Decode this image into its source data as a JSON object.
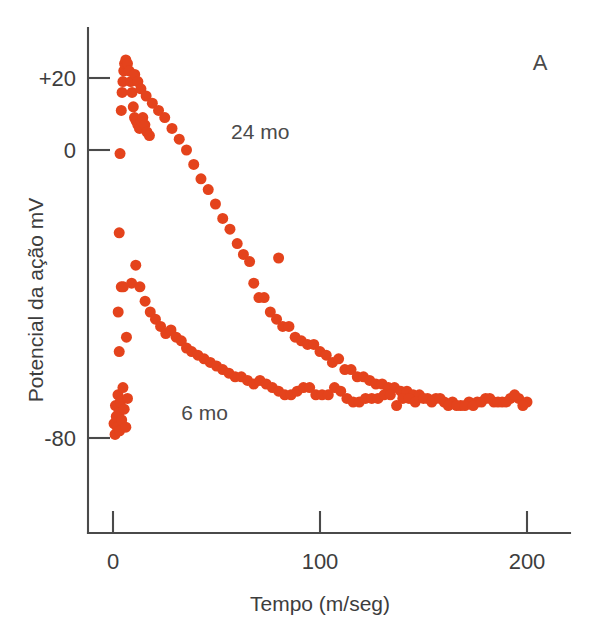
{
  "panel": {
    "label": "A"
  },
  "chart_data": {
    "type": "scatter",
    "title": "",
    "xlabel": "Tempo (m/seg)",
    "ylabel": "Potencial da ação mV",
    "xlim": [
      -8,
      215
    ],
    "ylim": [
      -110,
      34
    ],
    "xticks": [
      0,
      100,
      200
    ],
    "xticklabels": [
      "0",
      "100",
      "200"
    ],
    "yticks": [
      20,
      0,
      -80
    ],
    "yticklabels": [
      "+20",
      "0",
      "-80"
    ],
    "grid": false,
    "legend_position": "inline-annotation",
    "marker_color": "#E4431C",
    "marker_size_px": 11,
    "series": [
      {
        "name": "24 mo",
        "label": "24 mo",
        "annotation_xy": [
          57,
          3
        ],
        "points": [
          [
            0.5,
            -76
          ],
          [
            1.0,
            -79
          ],
          [
            1.2,
            -71
          ],
          [
            1.6,
            -74
          ],
          [
            2.0,
            -77
          ],
          [
            2.4,
            -68
          ],
          [
            2.8,
            -73
          ],
          [
            3.2,
            -78
          ],
          [
            3.6,
            -70
          ],
          [
            4.2,
            -75
          ],
          [
            4.8,
            -66
          ],
          [
            5.4,
            -72
          ],
          [
            6.2,
            -77
          ],
          [
            7.0,
            -69
          ],
          [
            2.5,
            -45
          ],
          [
            3.0,
            -23
          ],
          [
            3.4,
            -1
          ],
          [
            4.0,
            11
          ],
          [
            4.4,
            16
          ],
          [
            4.8,
            19
          ],
          [
            5.2,
            22
          ],
          [
            5.6,
            24
          ],
          [
            6.2,
            25
          ],
          [
            7.0,
            24
          ],
          [
            7.8,
            22
          ],
          [
            8.6,
            19
          ],
          [
            9.2,
            16
          ],
          [
            9.8,
            12
          ],
          [
            10.4,
            9
          ],
          [
            11.2,
            8
          ],
          [
            12.0,
            7
          ],
          [
            12.8,
            6
          ],
          [
            13.6,
            8
          ],
          [
            14.4,
            9
          ],
          [
            15.4,
            7
          ],
          [
            16.4,
            5
          ],
          [
            17.6,
            4
          ],
          [
            10.5,
            21
          ],
          [
            12.0,
            19
          ],
          [
            13.5,
            17
          ],
          [
            16.0,
            15
          ],
          [
            19.0,
            13
          ],
          [
            22.0,
            11
          ],
          [
            25.0,
            9
          ],
          [
            28.5,
            6
          ],
          [
            32.0,
            3
          ],
          [
            35.5,
            0
          ],
          [
            39.0,
            -4
          ],
          [
            42.5,
            -8
          ],
          [
            46.0,
            -11
          ],
          [
            49.5,
            -15
          ],
          [
            53.0,
            -19
          ],
          [
            56.5,
            -22
          ],
          [
            60.0,
            -26
          ],
          [
            63.0,
            -29
          ],
          [
            66.0,
            -31
          ],
          [
            80.0,
            -30
          ],
          [
            68.0,
            -37
          ],
          [
            70.5,
            -41
          ],
          [
            73.0,
            -41
          ],
          [
            76.0,
            -45
          ],
          [
            79.0,
            -47
          ],
          [
            82.0,
            -49
          ],
          [
            85.0,
            -49
          ],
          [
            88.0,
            -52
          ],
          [
            91.0,
            -53
          ],
          [
            94.0,
            -54
          ],
          [
            97.0,
            -54
          ],
          [
            100.0,
            -56
          ],
          [
            103.0,
            -57
          ],
          [
            106.0,
            -59
          ],
          [
            109.0,
            -58
          ],
          [
            112.0,
            -61
          ],
          [
            115.0,
            -61
          ],
          [
            118.0,
            -63
          ],
          [
            121.0,
            -63
          ],
          [
            124.0,
            -64
          ],
          [
            127.0,
            -65
          ],
          [
            130.0,
            -65
          ],
          [
            133.0,
            -66
          ],
          [
            136.0,
            -66
          ],
          [
            139.0,
            -67
          ],
          [
            142.0,
            -67
          ],
          [
            145.0,
            -68
          ],
          [
            148.0,
            -68
          ],
          [
            152.0,
            -69
          ],
          [
            156.0,
            -69
          ],
          [
            160.0,
            -70
          ],
          [
            164.0,
            -70
          ],
          [
            168.0,
            -71
          ],
          [
            172.0,
            -70
          ],
          [
            176.0,
            -70
          ],
          [
            180.0,
            -69
          ],
          [
            184.0,
            -70
          ],
          [
            188.0,
            -70
          ],
          [
            192.0,
            -69
          ],
          [
            196.0,
            -69
          ],
          [
            200.0,
            -70
          ]
        ]
      },
      {
        "name": "6 mo",
        "label": "6 mo",
        "annotation_xy": [
          33,
          -75
        ],
        "points": [
          [
            3.0,
            -56
          ],
          [
            4.0,
            -38
          ],
          [
            5.0,
            -38
          ],
          [
            6.5,
            -52
          ],
          [
            9.0,
            -37
          ],
          [
            11.0,
            -32
          ],
          [
            13.0,
            -38
          ],
          [
            15.5,
            -42
          ],
          [
            18.0,
            -45
          ],
          [
            20.5,
            -47
          ],
          [
            23.0,
            -49
          ],
          [
            25.5,
            -51
          ],
          [
            28.0,
            -50
          ],
          [
            30.5,
            -52
          ],
          [
            33.0,
            -53
          ],
          [
            35.5,
            -55
          ],
          [
            38.0,
            -56
          ],
          [
            41.0,
            -57
          ],
          [
            44.0,
            -58
          ],
          [
            47.0,
            -59
          ],
          [
            50.0,
            -60
          ],
          [
            53.0,
            -61
          ],
          [
            56.0,
            -62
          ],
          [
            59.0,
            -63
          ],
          [
            62.0,
            -63
          ],
          [
            65.0,
            -64
          ],
          [
            68.0,
            -65
          ],
          [
            71.0,
            -64
          ],
          [
            74.0,
            -65
          ],
          [
            77.0,
            -66
          ],
          [
            80.0,
            -67
          ],
          [
            83.0,
            -68
          ],
          [
            86.0,
            -68
          ],
          [
            89.0,
            -67
          ],
          [
            92.0,
            -66
          ],
          [
            95.0,
            -66
          ],
          [
            98.0,
            -68
          ],
          [
            101.0,
            -68
          ],
          [
            104.0,
            -68
          ],
          [
            107.0,
            -66
          ],
          [
            110.0,
            -67
          ],
          [
            113.0,
            -69
          ],
          [
            116.0,
            -70
          ],
          [
            119.0,
            -70
          ],
          [
            122.0,
            -69
          ],
          [
            125.0,
            -69
          ],
          [
            128.0,
            -69
          ],
          [
            131.0,
            -68
          ],
          [
            134.0,
            -68
          ],
          [
            137.0,
            -71
          ],
          [
            140.0,
            -69
          ],
          [
            143.0,
            -69
          ],
          [
            146.0,
            -70
          ],
          [
            150.0,
            -69
          ],
          [
            154.0,
            -70
          ],
          [
            158.0,
            -69
          ],
          [
            162.0,
            -71
          ],
          [
            166.0,
            -71
          ],
          [
            170.0,
            -71
          ],
          [
            174.0,
            -71
          ],
          [
            178.0,
            -70
          ],
          [
            182.0,
            -69
          ],
          [
            186.0,
            -70
          ],
          [
            190.0,
            -70
          ],
          [
            194.0,
            -68
          ],
          [
            198.0,
            -71
          ]
        ]
      }
    ]
  }
}
